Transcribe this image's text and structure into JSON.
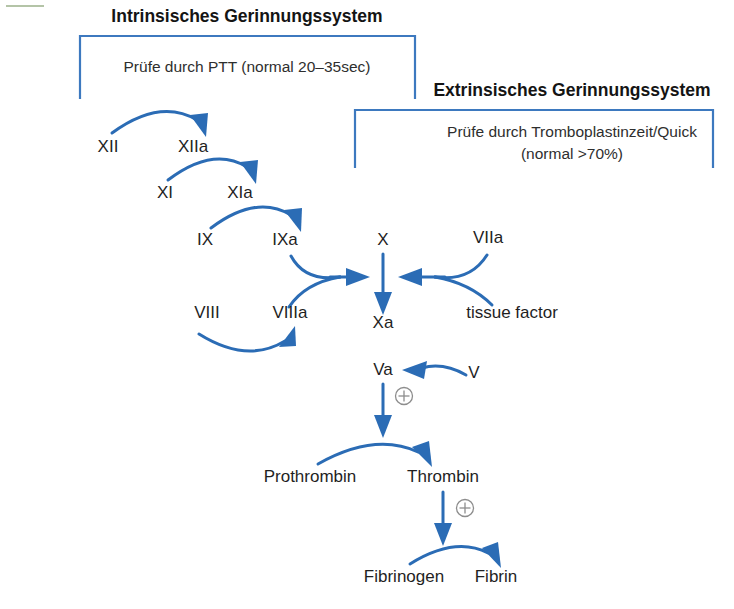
{
  "page": {
    "background": "#ffffff",
    "accent_blue": "#2b6cb5",
    "bracket_blue": "#3d79bf",
    "text_color": "#1f1f1f",
    "plus_color": "#8d8d8d"
  },
  "sections": [
    {
      "id": "intrinsic",
      "title": "Intrinsisches Gerinnungssystem",
      "subtitle_lines": [
        "Prüfe durch PTT (normal 20–35sec)"
      ],
      "title_x": 247,
      "title_y": 22,
      "subtitle_x": 247,
      "subtitle_y": 72,
      "bracket": {
        "x": 80,
        "y": 36,
        "width": 335,
        "height": 63
      }
    },
    {
      "id": "extrinsic",
      "title": "Extrinsisches Gerinnungssystem",
      "subtitle_lines": [
        "Prüfe durch Tromboplastinzeit/Quick",
        "(normal >70%)"
      ],
      "title_x": 572,
      "title_y": 96,
      "subtitle_x": 572,
      "subtitle_y": 137,
      "bracket": {
        "x": 355,
        "y": 110,
        "width": 358,
        "height": 58
      }
    }
  ],
  "nodes": [
    {
      "id": "f12",
      "label": "XII",
      "x": 108,
      "y": 152
    },
    {
      "id": "f12a",
      "label": "XIIa",
      "x": 193,
      "y": 152
    },
    {
      "id": "f11",
      "label": "XI",
      "x": 165,
      "y": 198
    },
    {
      "id": "f11a",
      "label": "XIa",
      "x": 240,
      "y": 198
    },
    {
      "id": "f9",
      "label": "IX",
      "x": 205,
      "y": 245
    },
    {
      "id": "f9a",
      "label": "IXa",
      "x": 285,
      "y": 245
    },
    {
      "id": "f10",
      "label": "X",
      "x": 383,
      "y": 245
    },
    {
      "id": "f7a",
      "label": "VIIa",
      "x": 488,
      "y": 243
    },
    {
      "id": "f8",
      "label": "VIII",
      "x": 207,
      "y": 318
    },
    {
      "id": "f8a",
      "label": "VIIIa",
      "x": 290,
      "y": 318
    },
    {
      "id": "f10a",
      "label": "Xa",
      "x": 383,
      "y": 328
    },
    {
      "id": "tissue",
      "label": "tissue factor",
      "x": 512,
      "y": 318
    },
    {
      "id": "f5a",
      "label": "Va",
      "x": 383,
      "y": 375
    },
    {
      "id": "f5",
      "label": "V",
      "x": 474,
      "y": 378
    },
    {
      "id": "prothrombin",
      "label": "Prothrombin",
      "x": 310,
      "y": 482
    },
    {
      "id": "thrombin",
      "label": "Thrombin",
      "x": 443,
      "y": 482
    },
    {
      "id": "fibrinogen",
      "label": "Fibrinogen",
      "x": 404,
      "y": 582
    },
    {
      "id": "fibrin",
      "label": "Fibrin",
      "x": 496,
      "y": 582
    }
  ],
  "reactions": [
    {
      "id": "xii-to-xiia",
      "from": "XII",
      "to": "XIIa",
      "type": "arc-over"
    },
    {
      "id": "xi-to-xia",
      "from": "XI",
      "to": "XIa",
      "type": "arc-over"
    },
    {
      "id": "ix-to-ixa",
      "from": "IX",
      "to": "IXa",
      "type": "arc-over"
    },
    {
      "id": "viii-to-viiia",
      "from": "VIII",
      "to": "VIIIa",
      "type": "arc-under"
    },
    {
      "id": "ixa-viiia-to-x",
      "from": "IXa + VIIIa",
      "to": "X",
      "type": "merge-right"
    },
    {
      "id": "viia-tf-to-x",
      "from": "VIIa + tissue factor",
      "to": "X",
      "type": "merge-left"
    },
    {
      "id": "x-to-xa",
      "from": "X",
      "to": "Xa",
      "type": "straight-down"
    },
    {
      "id": "v-to-va",
      "from": "V",
      "to": "Va",
      "type": "arc-left"
    },
    {
      "id": "va-to-prothrombin",
      "from": "Va",
      "to": "Prothrombin/Thrombin",
      "type": "straight-down",
      "modifier": "plus"
    },
    {
      "id": "prothrombin-to-thrombin",
      "from": "Prothrombin",
      "to": "Thrombin",
      "type": "arc-over"
    },
    {
      "id": "thrombin-to-fibrinogen",
      "from": "Thrombin",
      "to": "Fibrinogen/Fibrin",
      "type": "straight-down",
      "modifier": "plus"
    },
    {
      "id": "fibrinogen-to-fibrin",
      "from": "Fibrinogen",
      "to": "Fibrin",
      "type": "arc-over"
    }
  ],
  "modifiers": [
    {
      "id": "plus-va",
      "symbol": "+",
      "x": 404,
      "y": 396,
      "label": "activation-plus"
    },
    {
      "id": "plus-thrombin",
      "symbol": "+",
      "x": 465,
      "y": 508,
      "label": "activation-plus"
    }
  ]
}
